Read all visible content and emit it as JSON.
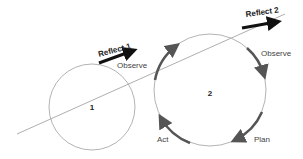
{
  "diagram": {
    "circles": [
      {
        "id": "1",
        "label": "1"
      },
      {
        "id": "2",
        "label": "2"
      }
    ],
    "tangent_arrows": [
      {
        "label": "Reflect 1"
      },
      {
        "label": "Reflect 2"
      }
    ],
    "cycle_labels": {
      "observe_left": "Observe",
      "observe_right": "Observe",
      "plan": "Plan",
      "act": "Act"
    },
    "colors": {
      "line": "#888888",
      "arrow": "#111111",
      "cycle_arrow": "#555555"
    }
  }
}
